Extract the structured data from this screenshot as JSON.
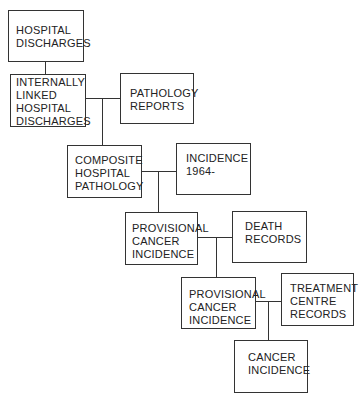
{
  "diagram": {
    "nodes": [
      {
        "id": "hospital-discharges",
        "label": "HOSPITAL\nDISCHARGES"
      },
      {
        "id": "internally-linked",
        "label": "INTERNALLY\nLINKED\nHOSPITAL\nDISCHARGES"
      },
      {
        "id": "pathology-reports",
        "label": "PATHOLOGY\nREPORTS"
      },
      {
        "id": "composite-hospital-pathology",
        "label": "COMPOSITE\nHOSPITAL\nPATHOLOGY"
      },
      {
        "id": "incidence-1964",
        "label": "INCIDENCE\n1964-"
      },
      {
        "id": "provisional-1",
        "label": "PROVISIONAL\nCANCER\nINCIDENCE"
      },
      {
        "id": "death-records",
        "label": "DEATH\nRECORDS"
      },
      {
        "id": "provisional-2",
        "label": "PROVISIONAL\nCANCER\nINCIDENCE"
      },
      {
        "id": "treatment-centre-records",
        "label": "TREATMENT\nCENTRE\nRECORDS"
      },
      {
        "id": "cancer-incidence",
        "label": "CANCER\nINCIDENCE"
      }
    ]
  }
}
